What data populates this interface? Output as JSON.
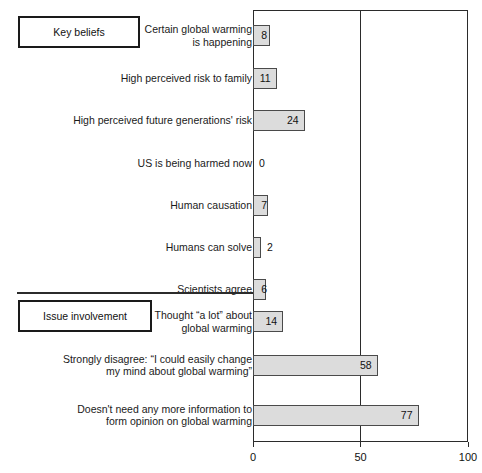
{
  "chart_data": {
    "type": "bar",
    "orientation": "horizontal",
    "title": "",
    "xlabel": "",
    "ylabel": "",
    "xlim": [
      0,
      100
    ],
    "xticks": [
      "0",
      "50",
      "100"
    ],
    "grid": "vertical gridline at 50",
    "legend": "none",
    "categories": [
      "Certain global warming\nis happening",
      "High perceived risk to family",
      "High perceived future generations' risk",
      "US is being harmed now",
      "Human causation",
      "Humans can solve",
      "Scientists agree",
      "Thought “a lot” about\nglobal warming",
      "Strongly disagree: “I could easily change\nmy mind about global warming”",
      "Doesn't need any more information to\nform opinion on global warming"
    ],
    "values": [
      8,
      11,
      24,
      0,
      7,
      2,
      6,
      14,
      58,
      77
    ],
    "value_label_placement": [
      "inside",
      "inside",
      "inside",
      "outside",
      "inside",
      "outside",
      "inside",
      "inside",
      "inside",
      "inside"
    ],
    "bar_fill_color": "#dcdcdc",
    "bar_border_color": "#4a4a4a",
    "axis_color": "#2b2b2b"
  },
  "sections": [
    {
      "label": "Key beliefs"
    },
    {
      "label": "Issue involvement"
    }
  ],
  "axis": {
    "ticks": [
      {
        "label": "0",
        "value": 0
      },
      {
        "label": "50",
        "value": 50
      },
      {
        "label": "100",
        "value": 100
      }
    ]
  },
  "rows": [
    {
      "label": "Certain global warming\nis happening",
      "value": 8,
      "value_text": "8",
      "inside": true
    },
    {
      "label": "High perceived risk to family",
      "value": 11,
      "value_text": "11",
      "inside": true
    },
    {
      "label": "High perceived future generations' risk",
      "value": 24,
      "value_text": "24",
      "inside": true
    },
    {
      "label": "US is being harmed now",
      "value": 0,
      "value_text": "0",
      "inside": false
    },
    {
      "label": "Human causation",
      "value": 7,
      "value_text": "7",
      "inside": true
    },
    {
      "label": "Humans can solve",
      "value": 2,
      "value_text": "2",
      "inside": false
    },
    {
      "label": "Scientists agree",
      "value": 6,
      "value_text": "6",
      "inside": true
    },
    {
      "label": "Thought “a lot” about\nglobal warming",
      "value": 14,
      "value_text": "14",
      "inside": true
    },
    {
      "label": "Strongly disagree: “I could easily change\nmy mind about global warming”",
      "value": 58,
      "value_text": "58",
      "inside": true
    },
    {
      "label": "Doesn't need any more information to\nform opinion on global warming",
      "value": 77,
      "value_text": "77",
      "inside": true
    }
  ]
}
